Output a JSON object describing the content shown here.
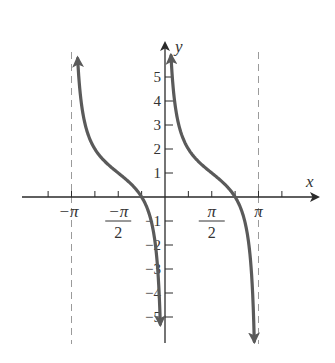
{
  "chart_data": {
    "type": "line",
    "title": "",
    "function": "y = 1 + cot(x)",
    "xlabel": "x",
    "ylabel": "y",
    "xlim": [
      -4.0,
      4.9
    ],
    "ylim": [
      -5.8,
      6.4
    ],
    "x_ticks": [
      {
        "value": -3.14159,
        "label": "-π"
      },
      {
        "value": -1.5708,
        "label": "-π/2",
        "num": "−π",
        "den": "2"
      },
      {
        "value": 1.5708,
        "label": "π/2",
        "num": "π",
        "den": "2"
      },
      {
        "value": 3.14159,
        "label": "π"
      }
    ],
    "x_minor_ticks": [
      -3.927,
      -2.356,
      -0.785,
      0.785,
      2.356,
      3.927
    ],
    "y_ticks": [
      {
        "value": 5,
        "label": "5"
      },
      {
        "value": 4,
        "label": "4"
      },
      {
        "value": 3,
        "label": "3"
      },
      {
        "value": 2,
        "label": "2"
      },
      {
        "value": 1,
        "label": "1"
      },
      {
        "value": -1,
        "label": "−1"
      },
      {
        "value": -2,
        "label": "−2"
      },
      {
        "value": -3,
        "label": "−3"
      },
      {
        "value": -4,
        "label": "−4"
      },
      {
        "value": -5,
        "label": "−5"
      }
    ],
    "asymptotes": [
      -3.14159,
      0,
      3.14159
    ],
    "dashed_asymptotes": [
      -3.14159,
      3.14159
    ],
    "series": [
      {
        "name": "branch-1",
        "domain": [
          -3.0,
          -0.13
        ],
        "points": [
          {
            "x": -2.98,
            "y": 7.2
          },
          {
            "x": -2.8,
            "y": 3.8
          },
          {
            "x": -2.5,
            "y": 2.34
          },
          {
            "x": -2.0,
            "y": 1.46
          },
          {
            "x": -1.5708,
            "y": 1.0
          },
          {
            "x": -1.0,
            "y": 0.36
          },
          {
            "x": -0.785,
            "y": 0.0
          },
          {
            "x": -0.5,
            "y": -0.83
          },
          {
            "x": -0.3,
            "y": -2.24
          },
          {
            "x": -0.18,
            "y": -4.5
          }
        ]
      },
      {
        "name": "branch-2",
        "domain": [
          0.12,
          3.0
        ],
        "points": [
          {
            "x": 0.18,
            "y": 6.5
          },
          {
            "x": 0.3,
            "y": 4.24
          },
          {
            "x": 0.5,
            "y": 2.83
          },
          {
            "x": 1.0,
            "y": 1.64
          },
          {
            "x": 1.5708,
            "y": 1.0
          },
          {
            "x": 2.0,
            "y": 0.54
          },
          {
            "x": 2.356,
            "y": 0.0
          },
          {
            "x": 2.6,
            "y": -0.7
          },
          {
            "x": 2.9,
            "y": -3.1
          },
          {
            "x": 3.0,
            "y": -6.0
          }
        ]
      }
    ],
    "grid": false,
    "legend": null
  },
  "axes": {
    "x_label": "x",
    "y_label": "y"
  },
  "colors": {
    "curve": "#5a5a5a",
    "axis": "#2a2a2a",
    "asymptote": "#9a9a9a"
  }
}
